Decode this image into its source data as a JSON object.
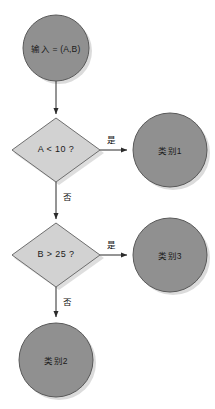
{
  "diagram": {
    "type": "flowchart",
    "colors": {
      "terminal_fill": "#909090",
      "terminal_stroke": "#595959",
      "decision_fill": "#d2d2d2",
      "decision_stroke": "#6e6e6e",
      "edge_stroke": "#2b2b2b",
      "text": "#1a1a1a",
      "background": "#ffffff",
      "shadow": "#b8b8b8"
    },
    "nodes": [
      {
        "id": "start",
        "shape": "circle",
        "label": "输入 = (A,B)",
        "cx": 56,
        "cy": 48,
        "r": 33
      },
      {
        "id": "decision-a",
        "shape": "diamond",
        "label": "A < 10 ?",
        "cx": 56,
        "cy": 150,
        "rx": 44,
        "ry": 32
      },
      {
        "id": "class-1",
        "shape": "circle",
        "label": "类别1",
        "cx": 170,
        "cy": 150,
        "r": 37
      },
      {
        "id": "decision-b",
        "shape": "diamond",
        "label": "B > 25 ?",
        "cx": 56,
        "cy": 255,
        "rx": 44,
        "ry": 32
      },
      {
        "id": "class-3",
        "shape": "circle",
        "label": "类别3",
        "cx": 170,
        "cy": 255,
        "r": 37
      },
      {
        "id": "class-2",
        "shape": "circle",
        "label": "类别2",
        "cx": 56,
        "cy": 360,
        "r": 37
      }
    ],
    "edges": [
      {
        "id": "start-to-a",
        "from": "start",
        "to": "decision-a",
        "label": "",
        "orientation": "vertical"
      },
      {
        "id": "a-yes",
        "from": "decision-a",
        "to": "class-1",
        "label": "是",
        "orientation": "horizontal",
        "label_x": 110,
        "label_y": 138
      },
      {
        "id": "a-no",
        "from": "decision-a",
        "to": "decision-b",
        "label": "否",
        "orientation": "vertical",
        "label_x": 63,
        "label_y": 192
      },
      {
        "id": "b-yes",
        "from": "decision-b",
        "to": "class-3",
        "label": "是",
        "orientation": "horizontal",
        "label_x": 110,
        "label_y": 243
      },
      {
        "id": "b-no",
        "from": "decision-b",
        "to": "class-2",
        "label": "否",
        "orientation": "vertical",
        "label_x": 63,
        "label_y": 297
      }
    ]
  }
}
